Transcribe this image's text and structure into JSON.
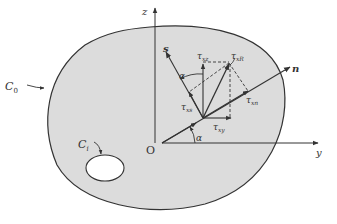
{
  "diagram": {
    "colors": {
      "region_fill": "#dcdcdc",
      "stroke": "#333333",
      "hole_fill": "#ffffff",
      "background": "#ffffff"
    },
    "labels": {
      "outer_boundary": "C",
      "outer_boundary_sub": "0",
      "inner_boundary": "C",
      "inner_boundary_sub": "i",
      "origin": "O",
      "y_axis": "y",
      "z_axis": "z",
      "n_axis": "n",
      "s_axis": "s",
      "alpha_bottom": "α",
      "alpha_top": "α",
      "tau": "τ",
      "tau_xz_sub": "xz",
      "tau_xy_sub": "xy",
      "tau_xs_sub": "xs",
      "tau_xn_sub": "xn",
      "tau_xR_sub": "xR"
    }
  }
}
